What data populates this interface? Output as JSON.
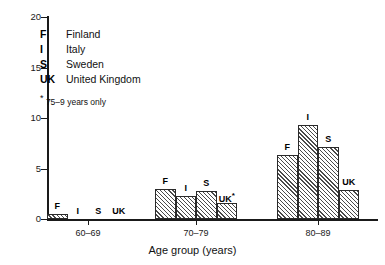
{
  "chart_data": {
    "type": "bar",
    "title": "",
    "xlabel": "Age group (years)",
    "ylabel": "",
    "categories": [
      "60–69",
      "70–79",
      "80–89"
    ],
    "ylim": [
      0,
      20
    ],
    "yticks": [
      0,
      5,
      10,
      15,
      20
    ],
    "ytick_labels": [
      "0",
      "5",
      "10",
      "15",
      "20"
    ],
    "grid": false,
    "legend_position": "upper-left-inside",
    "series": [
      {
        "name": "Finland",
        "key": "F",
        "values": [
          0.5,
          3.0,
          6.3
        ]
      },
      {
        "name": "Italy",
        "key": "I",
        "values": [
          0.0,
          2.3,
          9.3
        ]
      },
      {
        "name": "Sweden",
        "key": "S",
        "values": [
          0.0,
          2.8,
          7.1
        ]
      },
      {
        "name": "United Kingdom",
        "key": "UK",
        "values": [
          0.0,
          1.6,
          2.9
        ]
      }
    ],
    "bar_annotations": [
      {
        "group": "60–69",
        "key": "F",
        "label": "F",
        "starred": false
      },
      {
        "group": "60–69",
        "key": "I",
        "label": "I",
        "starred": false
      },
      {
        "group": "60–69",
        "key": "S",
        "label": "S",
        "starred": false
      },
      {
        "group": "60–69",
        "key": "UK",
        "label": "UK",
        "starred": false
      },
      {
        "group": "70–79",
        "key": "F",
        "label": "F",
        "starred": false
      },
      {
        "group": "70–79",
        "key": "I",
        "label": "I",
        "starred": false
      },
      {
        "group": "70–79",
        "key": "S",
        "label": "S",
        "starred": false
      },
      {
        "group": "70–79",
        "key": "UK",
        "label": "UK",
        "starred": true
      },
      {
        "group": "80–89",
        "key": "F",
        "label": "F",
        "starred": false
      },
      {
        "group": "80–89",
        "key": "I",
        "label": "I",
        "starred": false
      },
      {
        "group": "80–89",
        "key": "S",
        "label": "S",
        "starred": false
      },
      {
        "group": "80–89",
        "key": "UK",
        "label": "UK",
        "starred": false
      }
    ],
    "annotations": [
      "* 75–9 years only"
    ],
    "colors": {
      "axis": "#1a1a1a",
      "bar_edge": "#2a2a2a",
      "bar_fill": "#ffffff",
      "hatch": "#4a4a4a",
      "text": "#111111"
    }
  },
  "legend": {
    "items": [
      {
        "key": "F",
        "name": "Finland"
      },
      {
        "key": "I",
        "name": "Italy"
      },
      {
        "key": "S",
        "name": "Sweden"
      },
      {
        "key": "UK",
        "name": "United Kingdom"
      }
    ],
    "footnote_star": "*",
    "footnote_text": "75–9 years only"
  },
  "axis": {
    "x_title": "Age group (years)",
    "y_labels": [
      "20",
      "15",
      "10",
      "5",
      "0"
    ],
    "x_labels": [
      "60–69",
      "70–79",
      "80–89"
    ]
  }
}
